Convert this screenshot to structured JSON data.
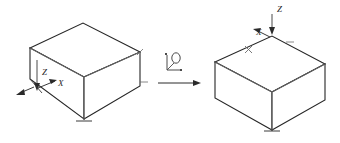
{
  "figure": {
    "background_color": "#ffffff",
    "line_color": "#262626",
    "thin_line_color": "#8a8a8a",
    "label_color": "#2a2a2a",
    "width": 340,
    "height": 143
  },
  "left_view": {
    "name": "source-orientation-box",
    "description": "Isometric cuboid shown in original orientation",
    "axes": [
      {
        "id": "z",
        "label": "Z",
        "label_x": 42,
        "label_y": 75,
        "direction": "down"
      },
      {
        "id": "x",
        "label": "X",
        "label_x": 58,
        "label_y": 86,
        "direction": "down-right"
      },
      {
        "id": "y",
        "label": "",
        "label_x": 22,
        "label_y": 92,
        "direction": "down-left"
      }
    ],
    "vertices": {
      "top_left": [
        30,
        48
      ],
      "top_back": [
        83,
        23
      ],
      "top_right": [
        140,
        52
      ],
      "top_front": [
        84,
        77
      ],
      "bottom_left": [
        30,
        79
      ],
      "bottom_front": [
        84,
        119
      ],
      "bottom_right": [
        140,
        86
      ]
    }
  },
  "right_view": {
    "name": "target-orientation-box",
    "description": "Isometric cuboid shown in rotated target orientation",
    "axes": [
      {
        "id": "z",
        "label": "Z",
        "label_x": 277,
        "label_y": 12,
        "direction": "down"
      },
      {
        "id": "x",
        "label": "X",
        "label_x": 259,
        "label_y": 35,
        "direction": "down-left"
      }
    ],
    "vertices": {
      "top_left": [
        215,
        62
      ],
      "top_back": [
        272,
        36
      ],
      "top_right": [
        325,
        64
      ],
      "top_front": [
        272,
        92
      ],
      "bottom_left": [
        215,
        98
      ],
      "bottom_front": [
        272,
        130
      ],
      "bottom_right": [
        325,
        100
      ]
    }
  },
  "transition": {
    "name": "transformation-arrow",
    "arrow_label": "",
    "symbol_name": "coordinate-rotation-icon",
    "symbol_description": "small L-shaped axis bracket with circular rotation marker",
    "arrow_from_x": 158,
    "arrow_to_x": 200,
    "arrow_y": 83
  }
}
